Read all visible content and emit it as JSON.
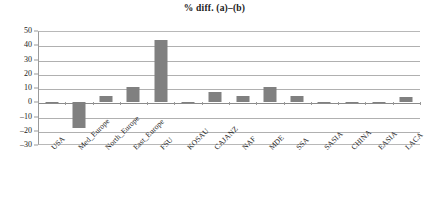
{
  "chart_data": {
    "type": "bar",
    "title": "% diff. (a)–(b)",
    "xlabel": "",
    "ylabel": "",
    "ylim": [
      -30,
      50
    ],
    "yticks": [
      50,
      40,
      30,
      20,
      10,
      0,
      -10,
      -20,
      -30
    ],
    "ytick_labels": [
      "50",
      "40",
      "30",
      "20",
      "10",
      "0",
      "–10",
      "–20",
      "–30"
    ],
    "grid": true,
    "legend": "none",
    "bar_color": "#808080",
    "categories": [
      "USA",
      "Med_Europe",
      "North_Europe",
      "East_Europe",
      "FSU",
      "KOSAU",
      "CAJANZ",
      "NAF",
      "MDE",
      "SSA",
      "SASIA",
      "CHINA",
      "EASIA",
      "LACA"
    ],
    "values": [
      -0.6,
      -18,
      4.5,
      11,
      43.5,
      0.5,
      7,
      4.5,
      11,
      4.5,
      -0.4,
      0.3,
      -0.5,
      4
    ]
  },
  "figure": {
    "background_color": "#ffffff",
    "axis_color": "#9a9a9a",
    "gridline_color": "#b0b0b0"
  }
}
